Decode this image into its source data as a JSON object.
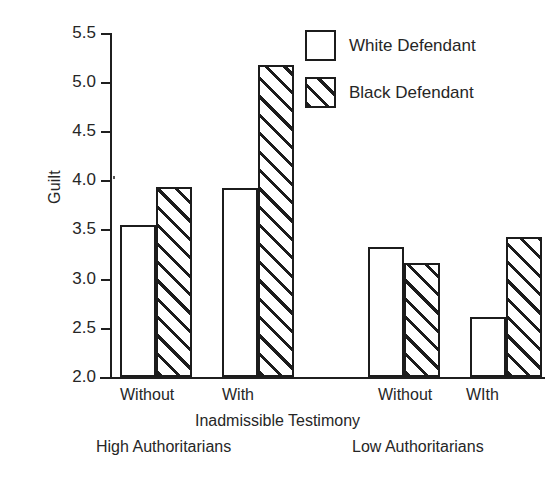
{
  "chart_data": {
    "type": "bar",
    "title": "",
    "xlabel": "Inadmissible Testimony",
    "ylabel": "Guilt",
    "ylim": [
      2.0,
      5.5
    ],
    "yticks": [
      "5.5",
      "5.0",
      "4.5",
      "4.0",
      "3.5",
      "3.0",
      "2.5",
      "2.0"
    ],
    "ytick_values": [
      5.5,
      5.0,
      4.5,
      4.0,
      3.5,
      3.0,
      2.5,
      2.0
    ],
    "grid": false,
    "legend_position": "top-right",
    "categories": [
      "Without",
      "With",
      "Without",
      "WIth"
    ],
    "groups": [
      {
        "name": "High Authoritarians",
        "categories": [
          "Without",
          "With"
        ]
      },
      {
        "name": "Low Authoritarians",
        "categories": [
          "Without",
          "WIth"
        ]
      }
    ],
    "series": [
      {
        "name": "White Defendant",
        "pattern": "solid",
        "values": [
          3.55,
          3.92,
          3.32,
          2.61
        ]
      },
      {
        "name": "Black Defendant",
        "pattern": "hatched",
        "values": [
          3.93,
          5.18,
          3.16,
          3.43
        ]
      }
    ],
    "bars": [
      {
        "group": "High Authoritarians",
        "category": "Without",
        "series": "White Defendant",
        "value": 3.55
      },
      {
        "group": "High Authoritarians",
        "category": "Without",
        "series": "Black Defendant",
        "value": 3.93
      },
      {
        "group": "High Authoritarians",
        "category": "With",
        "series": "White Defendant",
        "value": 3.92
      },
      {
        "group": "High Authoritarians",
        "category": "With",
        "series": "Black Defendant",
        "value": 5.18
      },
      {
        "group": "Low Authoritarians",
        "category": "Without",
        "series": "White Defendant",
        "value": 3.32
      },
      {
        "group": "Low Authoritarians",
        "category": "Without",
        "series": "Black Defendant",
        "value": 3.16
      },
      {
        "group": "Low Authoritarians",
        "category": "WIth",
        "series": "White Defendant",
        "value": 2.61
      },
      {
        "group": "Low Authoritarians",
        "category": "WIth",
        "series": "Black Defendant",
        "value": 3.43
      }
    ]
  },
  "axis": {
    "y_label": "Guilt",
    "x_label": "Inadmissible Testimony",
    "y_tick_labels": [
      "5.5",
      "5.0",
      "4.5",
      "4.0",
      "3.5",
      "3.0",
      "2.5",
      "2.0"
    ]
  },
  "x_labels": {
    "high_without": "Without",
    "high_with": "With",
    "low_without": "Without",
    "low_with": "WIth"
  },
  "group_labels": {
    "high": "High Authoritarians",
    "low": "Low Authoritarians"
  },
  "legend": {
    "items": [
      {
        "label": "White Defendant",
        "pattern": "solid"
      },
      {
        "label": "Black Defendant",
        "pattern": "hatched"
      }
    ]
  },
  "colors": {
    "ink": "#1c1c1c",
    "text": "#262626",
    "background": "#ffffff"
  }
}
